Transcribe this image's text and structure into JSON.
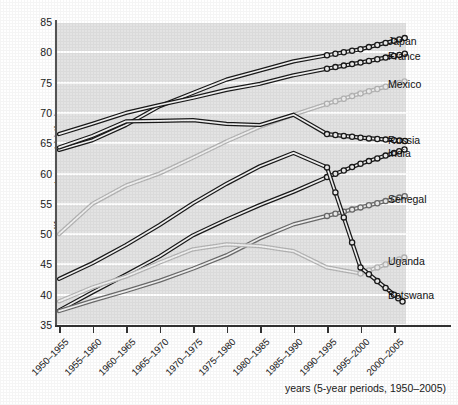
{
  "axes": {
    "y_title": "life expectancy at birth, in years",
    "x_caption": "years (5-year periods, 1950–2005)",
    "y_ticks": [
      "85",
      "80",
      "75",
      "70",
      "65",
      "60",
      "55",
      "50",
      "45",
      "40",
      "35"
    ],
    "x_ticks": [
      "1950–1955",
      "1955–1960",
      "1960–1965",
      "1965–1970",
      "1970–1975",
      "1975–1980",
      "1980–1985",
      "1985–1990",
      "1990–1995",
      "1995–2000",
      "2000–2005"
    ]
  },
  "labels": [
    {
      "name": "Japan",
      "text": "Japan"
    },
    {
      "name": "France",
      "text": "France"
    },
    {
      "name": "Mexico",
      "text": "Mexico"
    },
    {
      "name": "Russia",
      "text": "Russia"
    },
    {
      "name": "India",
      "text": "India"
    },
    {
      "name": "Senegal",
      "text": "Senegal"
    },
    {
      "name": "Uganda",
      "text": "Uganda"
    },
    {
      "name": "Botswana",
      "text": "Botswana"
    }
  ],
  "colors": {
    "plot_background": "#e3e3e3",
    "gridline": "#ffffff",
    "axis": "#333333",
    "dark_series": "#1a1a1a",
    "mid_series": "#6b6b6b",
    "light_series": "#b5b5b5",
    "text": "#1a1a1a"
  },
  "chart_data": {
    "type": "line",
    "title": "",
    "xlabel": "years (5-year periods, 1950–2005)",
    "ylabel": "life expectancy at birth, in years",
    "ylim": [
      35,
      85
    ],
    "ytick_step": 5,
    "grid": true,
    "legend": "inline-right-labels",
    "projection_note": "Open-circle markers mark the final projected periods (1995–2000 and 2000–2005)",
    "categories": [
      "1950–1955",
      "1955–1960",
      "1960–1965",
      "1965–1970",
      "1970–1975",
      "1975–1980",
      "1980–1985",
      "1985–1990",
      "1990–1995",
      "1995–2000",
      "2000–2005"
    ],
    "series": [
      {
        "name": "Japan",
        "tone": "dark",
        "values": [
          63.9,
          65.5,
          68.0,
          71.1,
          73.3,
          75.5,
          77.0,
          78.5,
          79.5,
          80.5,
          81.9
        ],
        "marker_from_index": 8
      },
      {
        "name": "France",
        "tone": "dark",
        "values": [
          66.5,
          68.2,
          70.0,
          71.3,
          72.5,
          73.8,
          74.8,
          76.2,
          77.3,
          78.3,
          79.4
        ],
        "marker_from_index": 8
      },
      {
        "name": "Mexico",
        "tone": "light",
        "values": [
          50.0,
          55.0,
          58.0,
          60.0,
          62.6,
          65.3,
          67.7,
          69.7,
          71.5,
          73.2,
          74.7
        ],
        "marker_from_index": 8
      },
      {
        "name": "Russia",
        "tone": "dark",
        "values": [
          64.3,
          66.2,
          68.6,
          68.7,
          68.8,
          68.2,
          68.0,
          69.7,
          66.5,
          65.9,
          65.5
        ],
        "marker_from_index": 8
      },
      {
        "name": "India",
        "tone": "dark",
        "values": [
          37.4,
          40.4,
          43.3,
          46.3,
          49.8,
          52.4,
          54.8,
          57.0,
          59.4,
          61.6,
          63.4
        ],
        "marker_from_index": 8
      },
      {
        "name": "Senegal",
        "tone": "mid",
        "values": [
          37.3,
          39.0,
          40.6,
          42.3,
          44.3,
          46.5,
          49.3,
          51.6,
          53.0,
          54.4,
          55.8
        ],
        "marker_from_index": 8
      },
      {
        "name": "Uganda",
        "tone": "light",
        "values": [
          38.9,
          41.2,
          43.0,
          45.3,
          47.5,
          48.3,
          48.0,
          47.2,
          44.5,
          43.5,
          45.5
        ],
        "marker_from_index": 9
      },
      {
        "name": "Botswana",
        "tone": "dark",
        "values": [
          42.6,
          45.2,
          48.2,
          51.5,
          55.1,
          58.3,
          61.2,
          63.4,
          61.0,
          44.5,
          40.0
        ],
        "marker_from_index": 8
      }
    ]
  }
}
